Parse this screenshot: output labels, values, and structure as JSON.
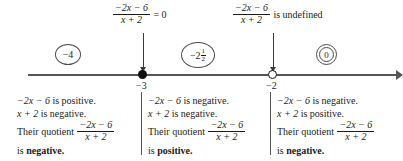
{
  "figure": {
    "type": "sign-chart-number-line",
    "expression": {
      "numerator": "−2x − 6",
      "denominator": "x + 2"
    }
  },
  "top_labels": [
    {
      "id": "zero-label",
      "numerator": "−2x − 6",
      "denominator": "x + 2",
      "relation": "= 0",
      "points_to": "−3"
    },
    {
      "id": "undefined-label",
      "numerator": "−2x − 6",
      "denominator": "x + 2",
      "relation": "is undefined",
      "points_to": "−2"
    }
  ],
  "test_values": [
    {
      "id": "left",
      "label": "−4"
    },
    {
      "id": "middle",
      "label": "−2",
      "fraction_num": "1",
      "fraction_den": "2"
    },
    {
      "id": "right",
      "label": "0"
    }
  ],
  "number_line": {
    "points": [
      {
        "value": "−3",
        "marker": "filled-dot"
      },
      {
        "value": "−2",
        "marker": "open-circle"
      }
    ],
    "arrow_direction": "right"
  },
  "blocks": [
    {
      "id": "left",
      "interval": "x < −3",
      "line1_expr": "−2x − 6",
      "line1_rest": " is positive.",
      "line2_expr": "x + 2",
      "line2_rest": " is negative.",
      "quotient_prefix": "Their quotient",
      "quotient_num": "−2x − 6",
      "quotient_den": "x + 2",
      "conclusion_prefix": "is ",
      "conclusion": "negative."
    },
    {
      "id": "middle",
      "interval": "−3 < x < −2",
      "line1_expr": "−2x − 6",
      "line1_rest": " is negative.",
      "line2_expr": "x + 2",
      "line2_rest": " is negative.",
      "quotient_prefix": "Their quotient",
      "quotient_num": "−2x − 6",
      "quotient_den": "x + 2",
      "conclusion_prefix": "is ",
      "conclusion": "positive."
    },
    {
      "id": "right",
      "interval": "x > −2",
      "line1_expr": "−2x − 6",
      "line1_rest": " is negative.",
      "line2_expr": "x + 2",
      "line2_rest": " is positive.",
      "quotient_prefix": "Their quotient",
      "quotient_num": "−2x − 6",
      "quotient_den": "x + 2",
      "conclusion_prefix": "is ",
      "conclusion": "negative."
    }
  ],
  "colors": {
    "ink": "#1a1a1a",
    "line": "#555555",
    "background": "#ffffff"
  }
}
